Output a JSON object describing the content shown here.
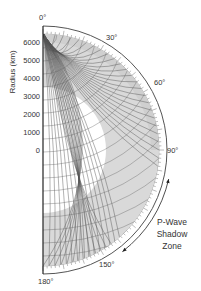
{
  "figure": {
    "title": "P-Wave Shadow Zone",
    "colors": {
      "mantle_fill": "#d9d9d9",
      "ring_fill": "#ffffff",
      "ray": "#444444",
      "text": "#333333",
      "axis": "#222222"
    },
    "axis": {
      "label": "Radius (km)",
      "ticks": [
        "6000",
        "5000",
        "4000",
        "3000",
        "2000",
        "1000",
        "0"
      ],
      "tick_values_km": [
        6000,
        5000,
        4000,
        3000,
        2000,
        1000,
        0
      ]
    },
    "angles": {
      "a0": "0°",
      "a30": "30°",
      "a60": "60°",
      "a90": "90°",
      "a150": "150°",
      "a180": "180°"
    },
    "annotation": {
      "line1": "P-Wave",
      "line2": "Shadow",
      "line3": "Zone",
      "arrow_from_deg": 103,
      "arrow_to_deg": 142
    },
    "earth_radius_km": 6371,
    "core_radius_km": 3480
  }
}
